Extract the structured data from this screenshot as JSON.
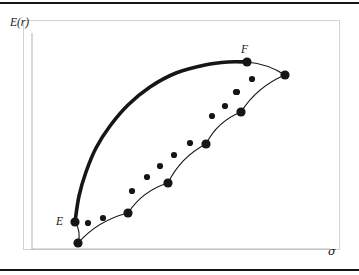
{
  "figure": {
    "name": "energy-vs-sigma-schematic",
    "axes": {
      "ylabel": "E(r)",
      "xlabel": "σ",
      "ylabel_icon": "energy-axis-label",
      "xlabel_icon": "sigma-axis-label"
    },
    "frame": {
      "border_color": "#d2d2d4",
      "background": "#ffffff",
      "rule_color": "#15161a"
    },
    "labels": [
      {
        "text": "E",
        "x": 56,
        "y": 216,
        "name": "point-label-e"
      },
      {
        "text": "F",
        "x": 241,
        "y": 44,
        "name": "point-label-f"
      }
    ]
  },
  "chart_data": {
    "type": "line",
    "title": "",
    "xlabel": "σ",
    "ylabel": "E(r)",
    "grid": false,
    "legend": "none",
    "annotations": [
      {
        "text": "E",
        "x": 75,
        "y": 222,
        "note": "left endpoint of envelope curve"
      },
      {
        "text": "F",
        "x": 247,
        "y": 62,
        "note": "right endpoint of envelope curve"
      }
    ],
    "series": [
      {
        "name": "envelope-curve",
        "style": "thick-smooth-concave",
        "stroke": "#15161a",
        "stroke_width": 3.6,
        "points": [
          [
            75,
            222
          ],
          [
            79,
            196
          ],
          [
            86,
            172
          ],
          [
            96,
            148
          ],
          [
            110,
            126
          ],
          [
            128,
            105
          ],
          [
            150,
            87
          ],
          [
            176,
            73
          ],
          [
            205,
            65
          ],
          [
            228,
            62
          ],
          [
            247,
            62
          ]
        ]
      },
      {
        "name": "scalloped-chain",
        "style": "arcs-between-nodes",
        "stroke": "#15161a",
        "stroke_width": 1.1,
        "nodes": [
          [
            78,
            243
          ],
          [
            128,
            213
          ],
          [
            168,
            183
          ],
          [
            206,
            144
          ],
          [
            241,
            112
          ],
          [
            285,
            75
          ]
        ],
        "arc_sag": 9,
        "arc_note": "each consecutive node pair joined by a circular arc bulging upward-left"
      },
      {
        "name": "tangent-stub-at-E",
        "style": "short-arc",
        "stroke": "#15161a",
        "stroke_width": 1.1,
        "points": [
          [
            75,
            222
          ],
          [
            78,
            243
          ]
        ]
      },
      {
        "name": "tangent-stub-at-F",
        "style": "short-arc",
        "stroke": "#15161a",
        "stroke_width": 1.1,
        "points": [
          [
            247,
            62
          ],
          [
            285,
            75
          ]
        ]
      }
    ],
    "large_markers": {
      "name": "chain-nodes",
      "marker": "filled-circle",
      "radius": 4.6,
      "color": "#15161a",
      "points": [
        [
          75,
          222
        ],
        [
          78,
          243
        ],
        [
          128,
          213
        ],
        [
          168,
          183
        ],
        [
          206,
          144
        ],
        [
          241,
          112
        ],
        [
          247,
          62
        ],
        [
          285,
          75
        ]
      ]
    },
    "small_markers": {
      "name": "satellite-dots",
      "marker": "filled-circle",
      "radius": 3.1,
      "color": "#15161a",
      "points": [
        [
          88,
          223
        ],
        [
          103,
          218
        ],
        [
          132,
          191
        ],
        [
          147,
          177
        ],
        [
          160,
          166
        ],
        [
          174,
          155
        ],
        [
          190,
          143
        ],
        [
          212,
          116
        ],
        [
          225,
          106
        ],
        [
          237,
          92
        ],
        [
          252,
          79
        ],
        [
          236,
          92
        ]
      ]
    }
  }
}
